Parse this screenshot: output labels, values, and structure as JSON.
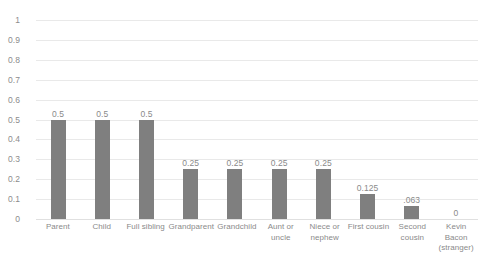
{
  "chart_data": {
    "type": "bar",
    "title": "",
    "subtitle": "",
    "xlabel": "",
    "ylabel": "",
    "ylim": [
      0,
      1
    ],
    "grid": true,
    "legend": false,
    "legend_position": "none",
    "orientation": "vertical",
    "bar_color": "#7f7f7f",
    "gridline_color": "#e9e9e9",
    "label_color": "#8a8a8a",
    "categories": [
      "Parent",
      "Child",
      "Full sibling",
      "Grandparent",
      "Grandchild",
      "Aunt or uncle",
      "Niece or nephew",
      "First cousin",
      "Second cousin",
      "Kevin Bacon (stranger)"
    ],
    "category_lines": [
      [
        "Parent"
      ],
      [
        "Child"
      ],
      [
        "Full sibling"
      ],
      [
        "Grandparent"
      ],
      [
        "Grandchild"
      ],
      [
        "Aunt or",
        "uncle"
      ],
      [
        "Niece or",
        "nephew"
      ],
      [
        "First cousin"
      ],
      [
        "Second",
        "cousin"
      ],
      [
        "Kevin Bacon",
        "(stranger)"
      ]
    ],
    "values": [
      0.5,
      0.5,
      0.5,
      0.25,
      0.25,
      0.25,
      0.25,
      0.125,
      0.063,
      0
    ],
    "value_labels": [
      "0.5",
      "0.5",
      "0.5",
      "0.25",
      "0.25",
      "0.25",
      "0.25",
      "0.125",
      ".063",
      "0"
    ],
    "yticks": [
      0,
      0.1,
      0.2,
      0.3,
      0.4,
      0.5,
      0.6,
      0.7,
      0.8,
      0.9,
      1
    ],
    "ytick_labels": [
      "0",
      "0.1",
      "0.2",
      "0.3",
      "0.4",
      "0.5",
      "0.6",
      "0.7",
      "0.8",
      "0.9",
      "1"
    ]
  }
}
